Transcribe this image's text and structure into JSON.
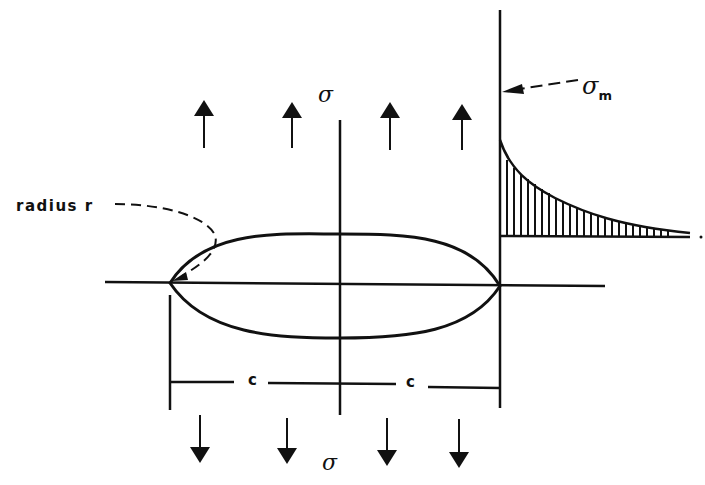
{
  "diagram": {
    "title": "",
    "labels": {
      "radius": "radius r",
      "sigma_top": "σ",
      "sigma_bottom": "σ",
      "sigma_max": "σ",
      "sigma_max_subscript": "m",
      "half_length_left": "c",
      "half_length_right": "c"
    },
    "elements": {
      "crack": "elliptical hole / crack with tip radius r and half-length c",
      "applied_stress_arrows_top": 4,
      "applied_stress_arrows_bottom": 4,
      "stress_distribution": "hatched stress profile decaying from maximum σm at crack tip"
    },
    "colors": {
      "ink": "#111111",
      "background": "#ffffff"
    }
  }
}
